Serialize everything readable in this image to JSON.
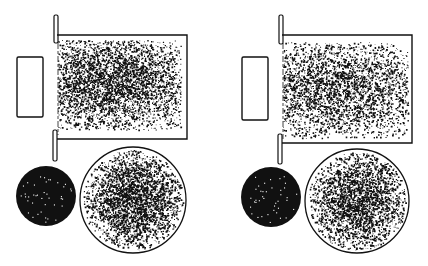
{
  "figure": {
    "width": 428,
    "height": 266,
    "background": "#ffffff",
    "ink": "#111111",
    "panels": [
      {
        "id": "left",
        "source_block": {
          "x": 17,
          "y": 57,
          "w": 26,
          "h": 60
        },
        "upper_slit": {
          "x": 54,
          "y": 15,
          "w": 4,
          "h": 28
        },
        "lower_slit": {
          "x": 53,
          "y": 130,
          "w": 4,
          "h": 31
        },
        "chamber": {
          "x": 57,
          "y": 35,
          "w": 130,
          "h": 104
        },
        "beam_cloud": {
          "x": 57,
          "y": 40,
          "w": 124,
          "h": 90,
          "cx": 110,
          "cy": 82,
          "sx": 48,
          "sy": 26,
          "count": 5200,
          "seed": 11
        },
        "small_disc": {
          "cx": 46,
          "cy": 196,
          "r": 30,
          "sparkles": 40,
          "seed": 21
        },
        "large_disc": {
          "cx": 133,
          "cy": 200,
          "r": 53,
          "core_sigma": 26,
          "count": 3600,
          "seed": 31
        }
      },
      {
        "id": "right",
        "source_block": {
          "x": 242,
          "y": 57,
          "w": 26,
          "h": 63
        },
        "upper_slit": {
          "x": 279,
          "y": 15,
          "w": 4,
          "h": 29
        },
        "lower_slit": {
          "x": 278,
          "y": 134,
          "w": 4,
          "h": 30
        },
        "chamber": {
          "x": 282,
          "y": 35,
          "w": 130,
          "h": 108
        },
        "beam_cloud": {
          "x": 282,
          "y": 42,
          "w": 126,
          "h": 96,
          "cx": 335,
          "cy": 88,
          "sx": 52,
          "sy": 28,
          "count": 4600,
          "seed": 17
        },
        "small_disc": {
          "cx": 271,
          "cy": 197,
          "r": 30,
          "sparkles": 40,
          "seed": 23
        },
        "large_disc": {
          "cx": 357,
          "cy": 201,
          "r": 52,
          "core_sigma": 28,
          "count": 3400,
          "seed": 37
        }
      }
    ]
  }
}
